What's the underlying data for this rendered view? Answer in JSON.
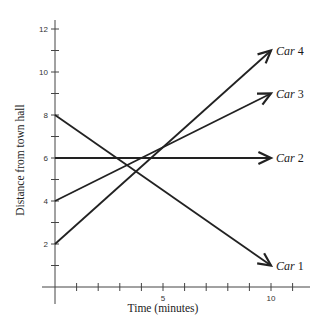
{
  "chart_data": {
    "type": "line",
    "title": "",
    "xlabel": "Time (minutes)",
    "ylabel": "Distance from town hall",
    "xlim": [
      0,
      11.5
    ],
    "ylim": [
      0,
      12.4
    ],
    "x_ticks": [
      1,
      2,
      3,
      4,
      5,
      6,
      7,
      8,
      9,
      10,
      11
    ],
    "x_tick_labels": {
      "5": "5",
      "10": "10"
    },
    "y_ticks": [
      1,
      2,
      3,
      4,
      5,
      6,
      7,
      8,
      9,
      10,
      11,
      12
    ],
    "y_tick_labels": {
      "2": "2",
      "4": "4",
      "6": "6",
      "8": "8",
      "10": "10",
      "12": "12"
    },
    "grid": false,
    "legend": "none (series labeled at arrow tips)",
    "series": [
      {
        "name": "Car 1",
        "label_prefix": "Car",
        "label_num": "1",
        "x": [
          0,
          10
        ],
        "y": [
          8,
          1
        ]
      },
      {
        "name": "Car 2",
        "label_prefix": "Car",
        "label_num": "2",
        "x": [
          0,
          10
        ],
        "y": [
          6,
          6
        ]
      },
      {
        "name": "Car 3",
        "label_prefix": "Car",
        "label_num": "3",
        "x": [
          0,
          10
        ],
        "y": [
          4,
          9
        ]
      },
      {
        "name": "Car 4",
        "label_prefix": "Car",
        "label_num": "4",
        "x": [
          0,
          10
        ],
        "y": [
          2,
          11
        ]
      }
    ],
    "line_color": "#222222"
  }
}
